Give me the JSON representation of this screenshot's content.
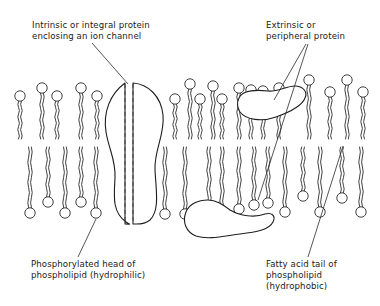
{
  "diagram": {
    "colors": {
      "ink": "#2a2a2a",
      "background": "#ffffff"
    },
    "labels": [
      {
        "id": "intrinsic",
        "lines": [
          "Intrinsic or integral protein",
          "enclosing an ion channel"
        ],
        "x": 32,
        "y": 20
      },
      {
        "id": "extrinsic",
        "lines": [
          "Extrinsic or",
          "peripheral protein"
        ],
        "x": 266,
        "y": 20
      },
      {
        "id": "head",
        "lines": [
          "Phosphorylated head of",
          "phospholipid (hydrophilic)"
        ],
        "x": 31,
        "y": 259
      },
      {
        "id": "tail",
        "lines": [
          "Fatty acid tail of",
          "phospholipid",
          "(hydrophobic)"
        ],
        "x": 266,
        "y": 259
      }
    ],
    "upper_leaflet": [
      {
        "x": 20,
        "hy": 96
      },
      {
        "x": 42,
        "hy": 88
      },
      {
        "x": 57,
        "hy": 96
      },
      {
        "x": 81,
        "hy": 88
      },
      {
        "x": 97,
        "hy": 96
      },
      {
        "x": 175,
        "hy": 99
      },
      {
        "x": 190,
        "hy": 84
      },
      {
        "x": 200,
        "hy": 99
      },
      {
        "x": 213,
        "hy": 86
      },
      {
        "x": 222,
        "hy": 99
      },
      {
        "x": 239,
        "hy": 88
      },
      {
        "x": 251,
        "hy": 90
      },
      {
        "x": 263,
        "hy": 91
      },
      {
        "x": 279,
        "hy": 88
      },
      {
        "x": 309,
        "hy": 80
      },
      {
        "x": 330,
        "hy": 92
      },
      {
        "x": 347,
        "hy": 80
      },
      {
        "x": 363,
        "hy": 92
      }
    ],
    "lower_leaflet": [
      {
        "x": 30,
        "hy": 213
      },
      {
        "x": 48,
        "hy": 202
      },
      {
        "x": 65,
        "hy": 213
      },
      {
        "x": 81,
        "hy": 202
      },
      {
        "x": 96,
        "hy": 213
      },
      {
        "x": 185,
        "hy": 214
      },
      {
        "x": 165,
        "hy": 214
      },
      {
        "x": 209,
        "hy": 208
      },
      {
        "x": 222,
        "hy": 211
      },
      {
        "x": 239,
        "hy": 209
      },
      {
        "x": 254,
        "hy": 205
      },
      {
        "x": 268,
        "hy": 203
      },
      {
        "x": 285,
        "hy": 212
      },
      {
        "x": 303,
        "hy": 196
      },
      {
        "x": 320,
        "hy": 212
      },
      {
        "x": 342,
        "hy": 198
      },
      {
        "x": 361,
        "hy": 212
      }
    ]
  }
}
